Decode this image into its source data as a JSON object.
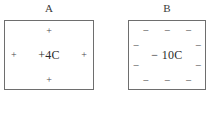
{
  "figure": {
    "background_color": "#ffffff",
    "line_color": "#6e6e6e",
    "text_color": "#2b2b2b"
  },
  "boxes": [
    {
      "label": "A",
      "center_text": "+4C",
      "sign": "+",
      "charges": [
        {
          "symbol": "+",
          "x": "50%",
          "y": "14%"
        },
        {
          "symbol": "+",
          "x": "10%",
          "y": "50%"
        },
        {
          "symbol": "+",
          "x": "90%",
          "y": "50%"
        },
        {
          "symbol": "+",
          "x": "50%",
          "y": "87%"
        }
      ]
    },
    {
      "label": "B",
      "center_text": "− 10C",
      "sign": "−",
      "charges": [
        {
          "symbol": "−",
          "x": "22%",
          "y": "13%"
        },
        {
          "symbol": "−",
          "x": "50%",
          "y": "13%"
        },
        {
          "symbol": "−",
          "x": "78%",
          "y": "13%"
        },
        {
          "symbol": "−",
          "x": "9%",
          "y": "35%"
        },
        {
          "symbol": "−",
          "x": "91%",
          "y": "35%"
        },
        {
          "symbol": "−",
          "x": "9%",
          "y": "65%"
        },
        {
          "symbol": "−",
          "x": "91%",
          "y": "65%"
        },
        {
          "symbol": "−",
          "x": "22%",
          "y": "87%"
        },
        {
          "symbol": "−",
          "x": "50%",
          "y": "87%"
        },
        {
          "symbol": "−",
          "x": "78%",
          "y": "87%"
        }
      ]
    }
  ]
}
